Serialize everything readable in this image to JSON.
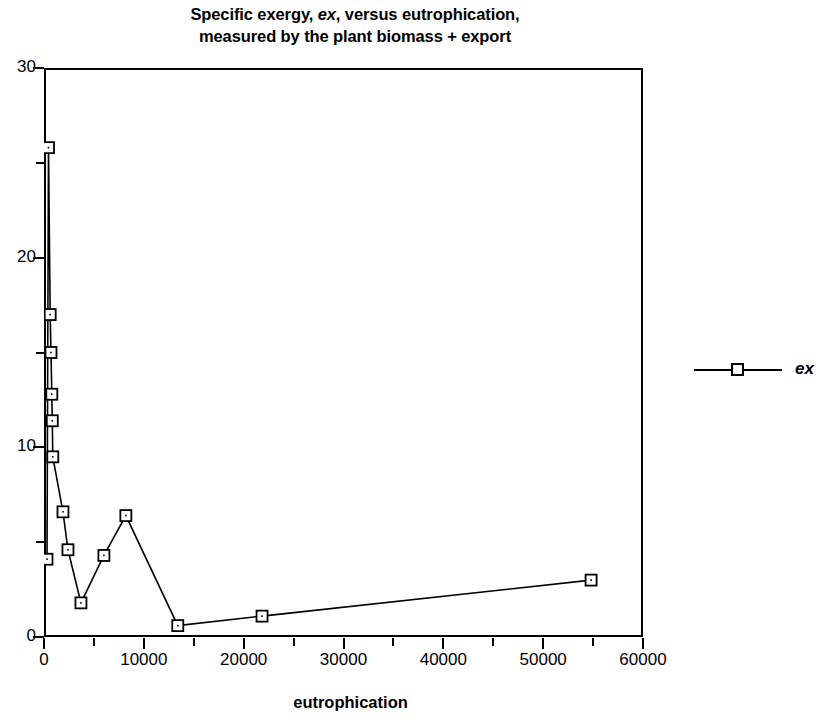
{
  "chart_data": {
    "type": "line",
    "title": "Specific exergy, ex, versus eutrophication, measured by the plant biomass + export",
    "title_line1_pre": "Specific exergy, ",
    "title_line1_ital": "ex",
    "title_line1_post": ", versus eutrophication,",
    "title_line2": "measured by the plant biomass + export",
    "xlabel": "eutrophication",
    "ylabel": "",
    "xlim": [
      0,
      60000
    ],
    "ylim": [
      0,
      30
    ],
    "grid": false,
    "legend_position": "right",
    "marker": "open-square",
    "line_color": "#000000",
    "xticks": [
      0,
      10000,
      20000,
      30000,
      40000,
      50000,
      60000
    ],
    "xtick_labels": [
      "0",
      "10000",
      "20000",
      "30000",
      "40000",
      "50000",
      "60000"
    ],
    "xticks_minor": [
      5000,
      15000,
      25000,
      35000,
      45000,
      55000
    ],
    "yticks": [
      0,
      10,
      20,
      30
    ],
    "ytick_labels": [
      "0",
      "10",
      "20",
      "30"
    ],
    "yticks_minor": [
      5,
      15,
      25
    ],
    "series": [
      {
        "name": "ex",
        "x": [
          300,
          450,
          620,
          700,
          780,
          830,
          880,
          1900,
          2400,
          3700,
          6000,
          8200,
          13400,
          21840,
          54800
        ],
        "y": [
          4.1,
          25.8,
          17.0,
          15.0,
          12.8,
          11.4,
          9.5,
          6.6,
          4.6,
          1.8,
          4.3,
          6.4,
          0.6,
          1.1,
          3.0
        ]
      }
    ]
  },
  "legend": {
    "label": "ex"
  }
}
